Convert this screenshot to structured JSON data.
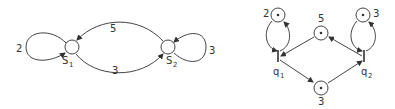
{
  "left_diagram": {
    "states": [
      {
        "id": "S1",
        "label": "S",
        "subscript": "1",
        "self_loop_weight": "2"
      },
      {
        "id": "S2",
        "label": "S",
        "subscript": "2",
        "self_loop_weight": "3"
      }
    ],
    "edges": [
      {
        "from": "S2",
        "to": "S1",
        "weight": "5"
      },
      {
        "from": "S1",
        "to": "S2",
        "weight": "3"
      }
    ]
  },
  "right_diagram": {
    "places": [
      {
        "id": "p_top_left",
        "tokens": 1,
        "label": "2"
      },
      {
        "id": "p_top_mid",
        "tokens": 1,
        "label": "5"
      },
      {
        "id": "p_top_right",
        "tokens": 1,
        "label": "3"
      },
      {
        "id": "p_bottom",
        "tokens": 1,
        "label": "3"
      }
    ],
    "transitions": [
      {
        "id": "q1",
        "label": "q",
        "subscript": "1"
      },
      {
        "id": "q2",
        "label": "q",
        "subscript": "2"
      }
    ]
  }
}
